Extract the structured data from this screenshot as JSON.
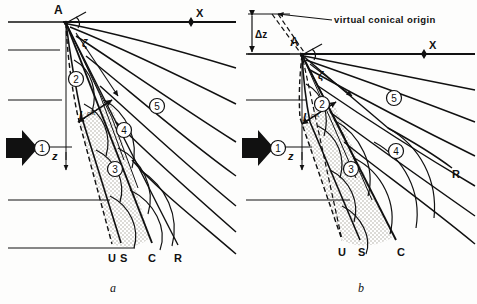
{
  "figure": {
    "type": "technical-line-diagram",
    "background_color": "#fdfdfc",
    "line_color": "#111111",
    "stipple_color": "#c9c6bd"
  },
  "panels": [
    {
      "id": "a",
      "caption": "a",
      "apex_label": "A",
      "axis_x_label": "X",
      "axis_z_label": "z",
      "angle_label": "ζ",
      "length_label": "L",
      "length_sub": "crit",
      "zones": [
        "1",
        "2",
        "3",
        "4",
        "5"
      ],
      "boundary_labels": [
        "U",
        "S",
        "C",
        "R"
      ],
      "flow_arrow": "thick-left-arrow"
    },
    {
      "id": "b",
      "caption": "b",
      "apex_label": "A",
      "axis_x_label": "X",
      "axis_z_label": "z",
      "angle_label": "ζ",
      "length_label": "L",
      "length_sub": "crit",
      "delta_z_label": "Δz",
      "annotation": "virtual conical origin",
      "zones": [
        "1",
        "2",
        "3",
        "4",
        "5"
      ],
      "boundary_labels": [
        "U",
        "S",
        "C",
        "R"
      ],
      "flow_arrow": "thick-left-arrow"
    }
  ]
}
